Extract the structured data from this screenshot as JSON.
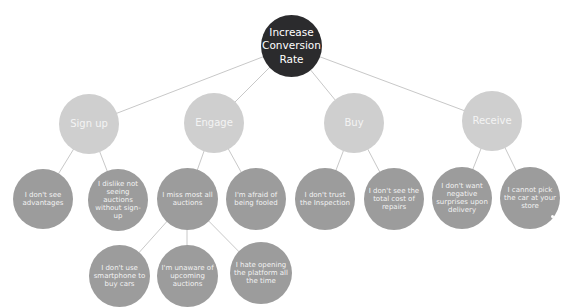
{
  "diagram": {
    "type": "tree",
    "colors": {
      "root": "#2b2b2d",
      "category": "#cfcfcf",
      "leaf": "#9c9c9c",
      "edge": "#c8c8c8"
    },
    "root": {
      "label": "Increase Conversion Rate"
    },
    "categories": [
      {
        "label": "Sign up"
      },
      {
        "label": "Engage"
      },
      {
        "label": "Buy"
      },
      {
        "label": "Receive"
      }
    ],
    "leaves": [
      {
        "parent": "Sign up",
        "label": "I don't see advantages"
      },
      {
        "parent": "Sign up",
        "label": "I dislike not seeing auctions without sign-up"
      },
      {
        "parent": "Engage",
        "label": "I miss most all auctions"
      },
      {
        "parent": "Engage",
        "label": "I'm afraid of being fooled"
      },
      {
        "parent": "Buy",
        "label": "I don't trust the Inspection"
      },
      {
        "parent": "Buy",
        "label": "I don't see the total cost of repairs"
      },
      {
        "parent": "Receive",
        "label": "I don't want negative surprises upon delivery"
      },
      {
        "parent": "Receive",
        "label": "I cannot pick the car at your store"
      }
    ],
    "subleaves": [
      {
        "parent": "I miss most all auctions",
        "label": "I don't use smartphone to buy cars"
      },
      {
        "parent": "I miss most all auctions",
        "label": "I'm unaware of upcoming auctions"
      },
      {
        "parent": "I miss most all auctions",
        "label": "I hate opening the platform all the time"
      }
    ]
  }
}
